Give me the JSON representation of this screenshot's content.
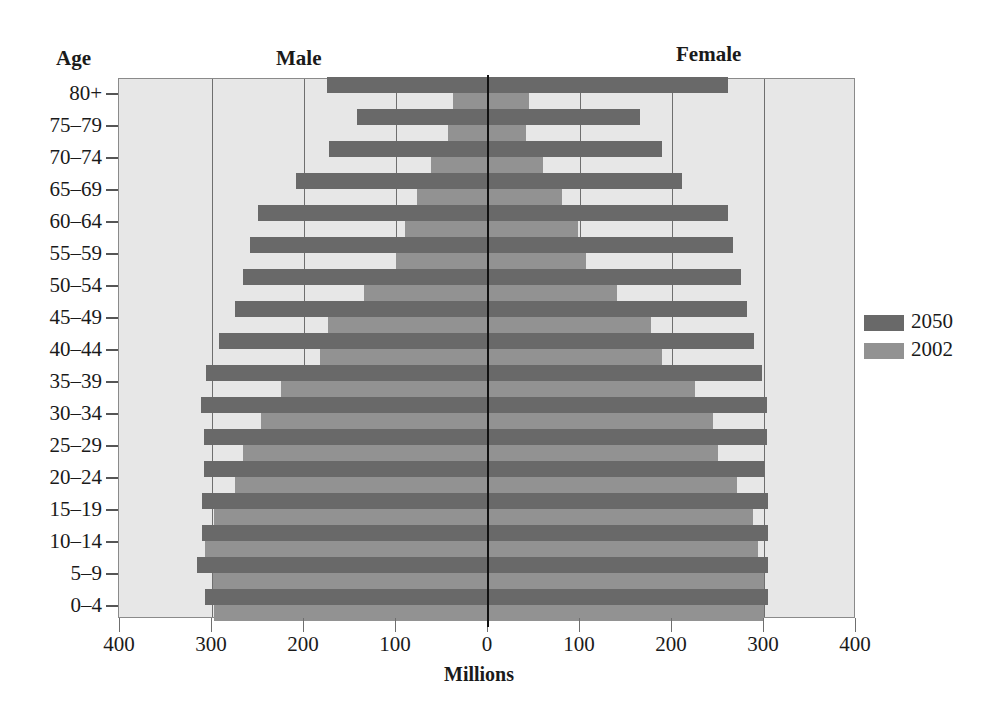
{
  "chart_data": {
    "type": "bar",
    "orientation": "horizontal",
    "subtype": "population-pyramid",
    "title": "",
    "left_header": "Male",
    "right_header": "Female",
    "ylabel": "Age",
    "xlabel": "Millions",
    "x_ticks_left": [
      "400",
      "300",
      "200",
      "100"
    ],
    "x_tick_center": "0",
    "x_ticks_right": [
      "100",
      "200",
      "300",
      "400"
    ],
    "xlim": [
      0,
      400
    ],
    "grid": true,
    "legend_position": "right",
    "categories": [
      "80+",
      "75–79",
      "70–74",
      "65–69",
      "60–64",
      "55–59",
      "50–54",
      "45–49",
      "40–44",
      "35–39",
      "30–34",
      "25–29",
      "20–24",
      "15–19",
      "10–14",
      "5–9",
      "0–4"
    ],
    "series": [
      {
        "name": "2050",
        "color": "#696969",
        "male": [
          175,
          142,
          173,
          209,
          250,
          259,
          266,
          275,
          292,
          306,
          312,
          309,
          309,
          311,
          311,
          316,
          308
        ],
        "female": [
          261,
          165,
          189,
          211,
          261,
          266,
          275,
          281,
          289,
          298,
          303,
          303,
          301,
          304,
          304,
          304,
          304
        ]
      },
      {
        "name": "2002",
        "color": "#929292",
        "male": [
          38,
          44,
          62,
          77,
          90,
          100,
          135,
          174,
          183,
          225,
          247,
          266,
          275,
          298,
          308,
          299,
          298
        ],
        "female": [
          45,
          41,
          60,
          80,
          98,
          106,
          140,
          177,
          189,
          225,
          245,
          250,
          271,
          288,
          294,
          300,
          300
        ]
      }
    ]
  },
  "labels": {
    "age": "Age",
    "male": "Male",
    "female": "Female",
    "millions": "Millions",
    "legend_2050": "2050",
    "legend_2002": "2002"
  }
}
